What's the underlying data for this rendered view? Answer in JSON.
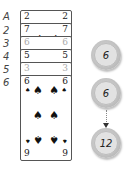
{
  "row_labels": [
    "A",
    "2",
    "3",
    "4",
    "5",
    "6"
  ],
  "cards": [
    {
      "rank": "2",
      "suit": "spade",
      "color": "black"
    },
    {
      "rank": "7",
      "suit": "spade",
      "color": "black"
    },
    {
      "rank": "6",
      "suit": "heart",
      "color": "red"
    },
    {
      "rank": "5",
      "suit": "spade",
      "color": "black"
    },
    {
      "rank": "3",
      "suit": "heart",
      "color": "red"
    },
    {
      "rank": "6",
      "suit": "spade",
      "color": "black",
      "bottom_rank": "9"
    }
  ],
  "chips": [
    {
      "value": "6"
    },
    {
      "value": "6"
    },
    {
      "value": "12"
    }
  ],
  "glyphs": {
    "spade": "♠"
  },
  "colors": {
    "red_suit": "#aaaaaa",
    "black_suit": "#222222",
    "chip": "#c4c4c4"
  }
}
